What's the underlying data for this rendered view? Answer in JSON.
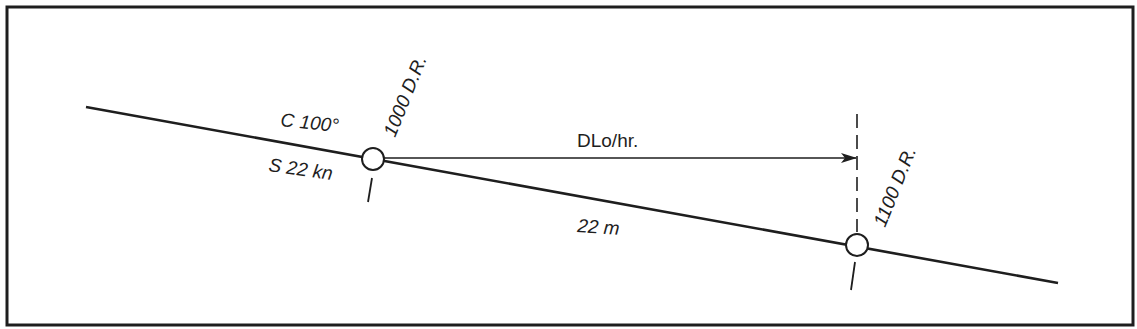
{
  "diagram": {
    "title": "",
    "colors": {
      "ink": "#1e1e1e",
      "background": "#ffffff"
    },
    "frame": {
      "x": 7,
      "y": 7,
      "width": 1126,
      "height": 318
    },
    "course_line": {
      "x1": 86,
      "y1": 107,
      "x2": 1058,
      "y2": 283
    },
    "labels": {
      "course": "C 100°",
      "speed": "S 22 kn",
      "position_1000": "1000 D.R.",
      "position_1100": "1100 D.R.",
      "dlo": "DLo/hr.",
      "distance": "22 m"
    },
    "points": [
      {
        "id": "dr-1000",
        "cx": 373,
        "cy": 159,
        "r": 11,
        "label": "1000 D.R."
      },
      {
        "id": "dr-1100",
        "cx": 857,
        "cy": 245,
        "r": 11,
        "label": "1100 D.R."
      }
    ],
    "dlo_arrow": {
      "x1": 385,
      "y1": 158,
      "x2": 856,
      "y2": 158
    },
    "meridian_dashed": {
      "x": 857,
      "y1": 114,
      "y2": 232
    }
  }
}
